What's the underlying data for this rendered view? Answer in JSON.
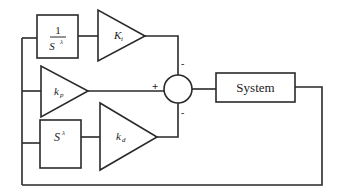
{
  "diagram": {
    "type": "block-diagram",
    "blocks": {
      "integrator": {
        "numerator": "1",
        "denominator_base": "S",
        "denominator_exp": "λ"
      },
      "ki_gain": {
        "symbol": "K",
        "subscript": "i"
      },
      "kp_gain": {
        "symbol": "k",
        "subscript": "p"
      },
      "differentiator": {
        "base": "S",
        "exp": "λ"
      },
      "kd_gain": {
        "symbol": "k",
        "subscript": "d"
      },
      "system": {
        "label": "System"
      }
    },
    "summing_junction": {
      "signs": {
        "top": "-",
        "left": "+",
        "bottom": "-"
      }
    },
    "colors": {
      "stroke": "#2a2a2a",
      "background": "#ffffff"
    }
  }
}
